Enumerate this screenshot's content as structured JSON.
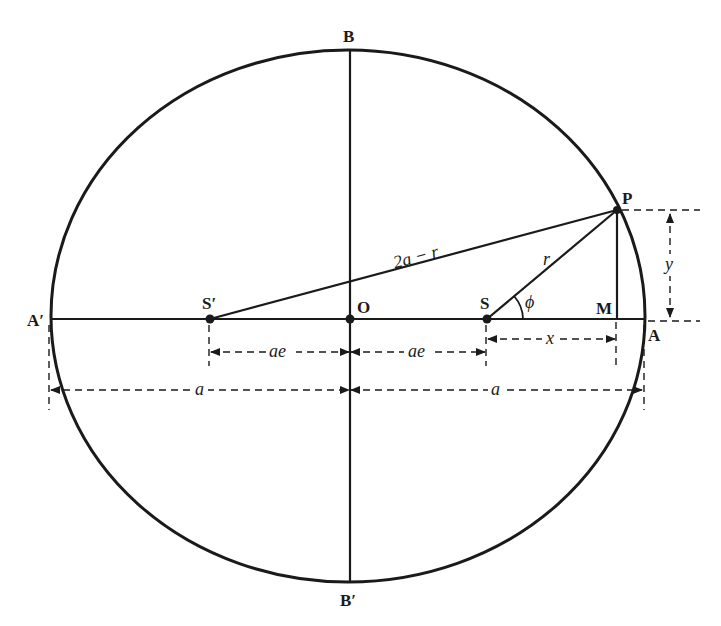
{
  "diagram": {
    "colors": {
      "ink": "#1a1a1a",
      "background": "#ffffff"
    },
    "points": {
      "B": "B",
      "B_prime": "B′",
      "A": "A",
      "A_prime": "A′",
      "O": "O",
      "S": "S",
      "S_prime": "S′",
      "P": "P",
      "M": "M"
    },
    "segment_labels": {
      "S_prime_P": "2a − r",
      "SP": "r",
      "angle": "ϕ",
      "x": "x",
      "y": "y",
      "ae_left": "ae",
      "ae_right": "ae",
      "a_left": "a",
      "a_right": "a"
    }
  }
}
